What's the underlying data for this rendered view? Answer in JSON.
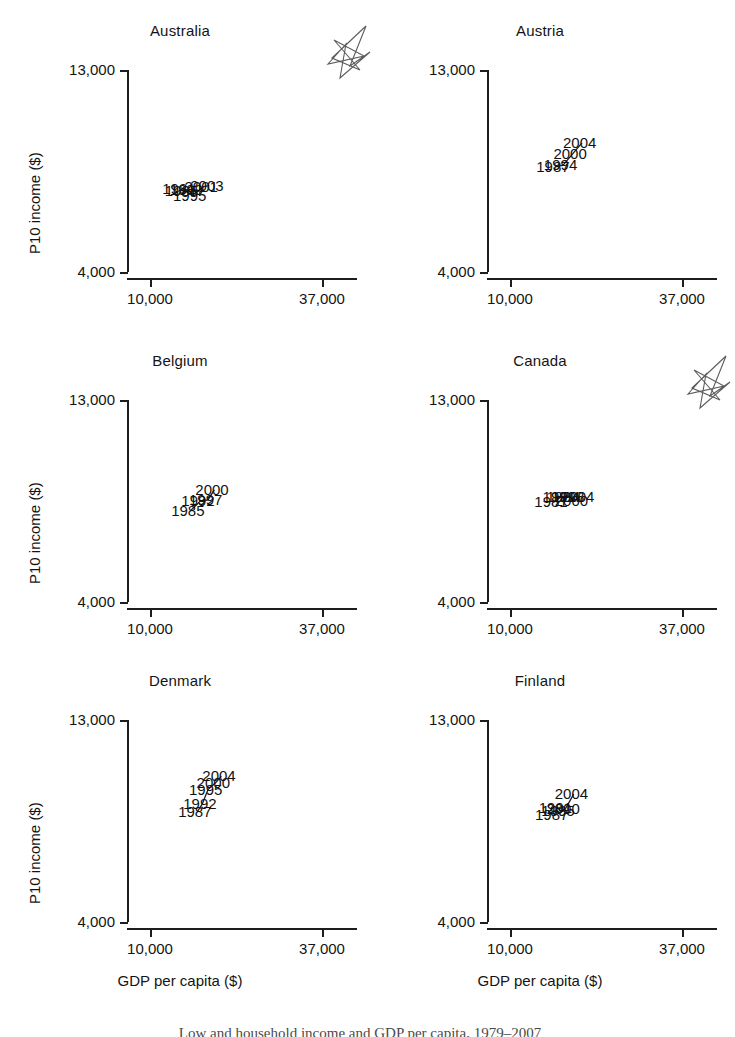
{
  "figure": {
    "shared_xlabel": "GDP per capita ($)",
    "shared_ylabel": "P10 income ($)",
    "xtick_labels": [
      "10,000",
      "37,000"
    ],
    "ytick_labels": [
      "13,000",
      "4,000"
    ],
    "caption_partial": "Low and household income and GDP per capita, 1979–2007"
  },
  "chart_data": {
    "type": "scatter",
    "title": "",
    "xlabel": "GDP per capita ($)",
    "ylabel": "P10 income ($)",
    "xlim": [
      10000,
      37000
    ],
    "ylim": [
      4000,
      13000
    ],
    "xticks": [
      10000,
      37000
    ],
    "yticks": [
      4000,
      13000
    ],
    "xtick_labels": [
      "10,000",
      "37,000"
    ],
    "ytick_labels": [
      "4,000",
      "13,000"
    ],
    "grid": false,
    "legend": "none",
    "connected": true,
    "panel_layout": {
      "rows": 3,
      "cols": 2
    },
    "panels": [
      {
        "name": "Australia",
        "points": [
          {
            "label": "1981",
            "x": 14900,
            "y": 7700
          },
          {
            "label": "1985",
            "x": 15300,
            "y": 7600
          },
          {
            "label": "1989",
            "x": 16100,
            "y": 7650
          },
          {
            "label": "1995",
            "x": 16600,
            "y": 7400
          },
          {
            "label": "2001",
            "x": 18400,
            "y": 7800
          },
          {
            "label": "2003",
            "x": 19300,
            "y": 7850
          }
        ]
      },
      {
        "name": "Austria",
        "points": [
          {
            "label": "1987",
            "x": 17100,
            "y": 8700
          },
          {
            "label": "1994",
            "x": 18300,
            "y": 8750
          },
          {
            "label": "2000",
            "x": 19800,
            "y": 9250
          },
          {
            "label": "2004",
            "x": 21300,
            "y": 9750
          }
        ]
      },
      {
        "name": "Belgium",
        "points": [
          {
            "label": "1985",
            "x": 16300,
            "y": 8050
          },
          {
            "label": "1992",
            "x": 17900,
            "y": 8500
          },
          {
            "label": "1997",
            "x": 19100,
            "y": 8550
          },
          {
            "label": "2000",
            "x": 20100,
            "y": 9000
          }
        ]
      },
      {
        "name": "Canada",
        "points": [
          {
            "label": "1981",
            "x": 16800,
            "y": 8450
          },
          {
            "label": "1991",
            "x": 18100,
            "y": 8700
          },
          {
            "label": "1994",
            "x": 18700,
            "y": 8700
          },
          {
            "label": "1998",
            "x": 19400,
            "y": 8700
          },
          {
            "label": "2000",
            "x": 20000,
            "y": 8500
          },
          {
            "label": "2004",
            "x": 21000,
            "y": 8700
          }
        ]
      },
      {
        "name": "Denmark",
        "points": [
          {
            "label": "1987",
            "x": 17400,
            "y": 8900
          },
          {
            "label": "1992",
            "x": 18200,
            "y": 9250
          },
          {
            "label": "1995",
            "x": 19100,
            "y": 9900
          },
          {
            "label": "2000",
            "x": 20300,
            "y": 10200
          },
          {
            "label": "2004",
            "x": 21200,
            "y": 10500
          }
        ]
      },
      {
        "name": "Finland",
        "points": [
          {
            "label": "1987",
            "x": 16900,
            "y": 8750
          },
          {
            "label": "1991",
            "x": 17500,
            "y": 9100
          },
          {
            "label": "1995",
            "x": 17900,
            "y": 8950
          },
          {
            "label": "2000",
            "x": 18700,
            "y": 9050
          },
          {
            "label": "2004",
            "x": 20000,
            "y": 9700
          }
        ]
      }
    ],
    "annotations": [
      {
        "kind": "scribble-mark",
        "panel": "Australia",
        "position": "top-right"
      },
      {
        "kind": "scribble-mark",
        "panel": "Canada",
        "position": "top-right"
      }
    ]
  }
}
